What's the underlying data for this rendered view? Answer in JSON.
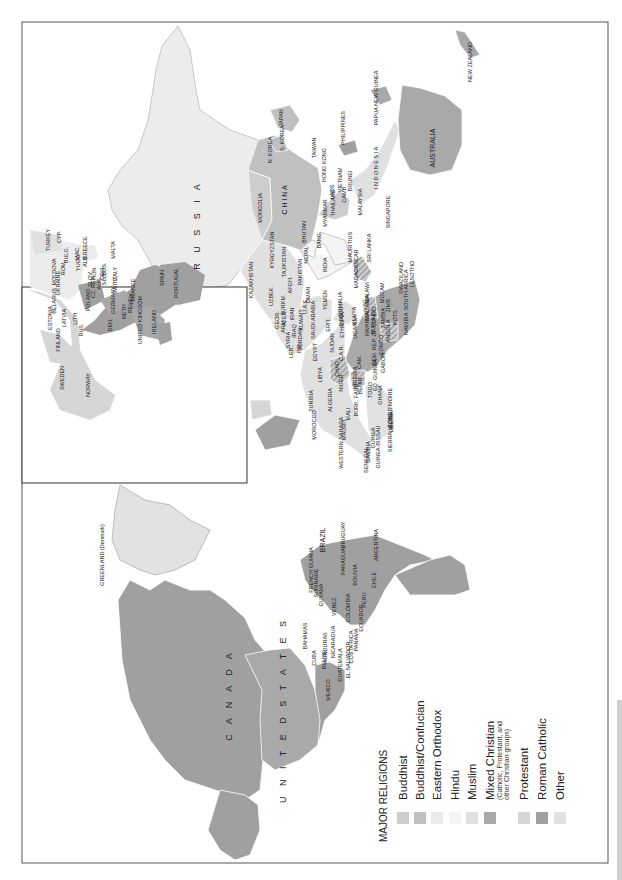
{
  "map": {
    "title": "MAJOR RELIGIONS",
    "orientation": "rotated 90° counterclockwise",
    "legend": [
      {
        "label": "Buddhist",
        "color": "#cdcdcd"
      },
      {
        "label": "Buddhist/Confucian",
        "color": "#c0c0c0"
      },
      {
        "label": "Eastern Orthodox",
        "color": "#ebebeb"
      },
      {
        "label": "Hindu",
        "color": "#f4f4f4"
      },
      {
        "label": "Muslim",
        "color": "#e0e0e0"
      },
      {
        "label": "Mixed Christian",
        "sublabel": "(Catholic, Protestant, and other Christian groups)",
        "color": "#a9a9a9"
      },
      {
        "label": "Protestant",
        "color": "#d6d6d6"
      },
      {
        "label": "Roman Catholic",
        "color": "#a0a0a0"
      },
      {
        "label": "Other",
        "color": "#e2e2e2"
      }
    ],
    "labels": [
      {
        "text": "R U S S I A",
        "x": 200,
        "y": 225,
        "size": "big"
      },
      {
        "text": "MONGOLIA",
        "x": 262,
        "y": 208
      },
      {
        "text": "C H I N A",
        "x": 287,
        "y": 200,
        "size": "mid"
      },
      {
        "text": "N. KOREA",
        "x": 272,
        "y": 150
      },
      {
        "text": "S. KOREA",
        "x": 284,
        "y": 138
      },
      {
        "text": "JAPAN",
        "x": 283,
        "y": 118
      },
      {
        "text": "TAIWAN",
        "x": 316,
        "y": 148
      },
      {
        "text": "HONG KONG",
        "x": 326,
        "y": 165
      },
      {
        "text": "PHILIPPINES",
        "x": 345,
        "y": 128
      },
      {
        "text": "VIETNAM",
        "x": 342,
        "y": 180
      },
      {
        "text": "LAOS",
        "x": 334,
        "y": 192
      },
      {
        "text": "THAILAND",
        "x": 335,
        "y": 203
      },
      {
        "text": "CAMB.",
        "x": 346,
        "y": 194
      },
      {
        "text": "MYANMAR",
        "x": 327,
        "y": 213
      },
      {
        "text": "BRUNEI",
        "x": 352,
        "y": 181
      },
      {
        "text": "MALAYSIA",
        "x": 362,
        "y": 202
      },
      {
        "text": "SINGAPORE",
        "x": 390,
        "y": 212
      },
      {
        "text": "I N D O N E S I A",
        "x": 378,
        "y": 168
      },
      {
        "text": "PAPUA NEW GUINEA",
        "x": 378,
        "y": 98
      },
      {
        "text": "AUSTRALIA",
        "x": 435,
        "y": 148,
        "size": "mid"
      },
      {
        "text": "NEW ZEALAND",
        "x": 472,
        "y": 62
      },
      {
        "text": "BHUTAN",
        "x": 306,
        "y": 232
      },
      {
        "text": "NEPAL",
        "x": 308,
        "y": 255
      },
      {
        "text": "BANG.",
        "x": 321,
        "y": 240
      },
      {
        "text": "INDIA",
        "x": 327,
        "y": 265
      },
      {
        "text": "SRI LANKA",
        "x": 371,
        "y": 248
      },
      {
        "text": "KYRGYZSTAN",
        "x": 274,
        "y": 250
      },
      {
        "text": "TAJIKISTAN",
        "x": 286,
        "y": 262
      },
      {
        "text": "KAZAKHSTAN",
        "x": 253,
        "y": 280
      },
      {
        "text": "UZBEK.",
        "x": 273,
        "y": 296
      },
      {
        "text": "TURKM.",
        "x": 285,
        "y": 305
      },
      {
        "text": "AFGH.",
        "x": 292,
        "y": 285
      },
      {
        "text": "PAKISTAN",
        "x": 302,
        "y": 272
      },
      {
        "text": "IRAN",
        "x": 294,
        "y": 314
      },
      {
        "text": "IRAQ",
        "x": 296,
        "y": 331
      },
      {
        "text": "KUWAIT",
        "x": 303,
        "y": 320
      },
      {
        "text": "U.A.E.",
        "x": 307,
        "y": 306
      },
      {
        "text": "OMAN",
        "x": 310,
        "y": 295
      },
      {
        "text": "SAUDI ARABIA",
        "x": 315,
        "y": 320
      },
      {
        "text": "YEMEN",
        "x": 327,
        "y": 300
      },
      {
        "text": "SYRIA",
        "x": 290,
        "y": 340
      },
      {
        "text": "JORDAN",
        "x": 302,
        "y": 339
      },
      {
        "text": "ISR.",
        "x": 301,
        "y": 348
      },
      {
        "text": "LEB.",
        "x": 293,
        "y": 352
      },
      {
        "text": "GEOR.",
        "x": 279,
        "y": 320
      },
      {
        "text": "ARM.",
        "x": 285,
        "y": 326
      },
      {
        "text": "AZER.",
        "x": 286,
        "y": 318
      },
      {
        "text": "EGYPT",
        "x": 317,
        "y": 352
      },
      {
        "text": "ERIT.",
        "x": 330,
        "y": 325
      },
      {
        "text": "DJIBOUTI",
        "x": 343,
        "y": 314
      },
      {
        "text": "ETHIOPIA",
        "x": 344,
        "y": 325
      },
      {
        "text": "SOMALIA",
        "x": 342,
        "y": 304
      },
      {
        "text": "SUDAN",
        "x": 334,
        "y": 343
      },
      {
        "text": "KENYA",
        "x": 356,
        "y": 316
      },
      {
        "text": "TANZANIA",
        "x": 369,
        "y": 308
      },
      {
        "text": "MALAWI",
        "x": 369,
        "y": 293
      },
      {
        "text": "MADAGASCAR",
        "x": 358,
        "y": 269
      },
      {
        "text": "MAURITIUS",
        "x": 352,
        "y": 247
      },
      {
        "text": "MOZAM.",
        "x": 384,
        "y": 292
      },
      {
        "text": "ZIMB.",
        "x": 390,
        "y": 305
      },
      {
        "text": "SWAZILAND",
        "x": 403,
        "y": 278
      },
      {
        "text": "LESOTHO",
        "x": 414,
        "y": 274
      },
      {
        "text": "SOUTH AFRICA",
        "x": 408,
        "y": 290
      },
      {
        "text": "BOTS.",
        "x": 397,
        "y": 317
      },
      {
        "text": "NAMIBIA",
        "x": 408,
        "y": 324
      },
      {
        "text": "ZAMBIA",
        "x": 385,
        "y": 318
      },
      {
        "text": "ANGOLA",
        "x": 390,
        "y": 331
      },
      {
        "text": "RWANDA",
        "x": 369,
        "y": 324
      },
      {
        "text": "BURUNDI",
        "x": 375,
        "y": 322
      },
      {
        "text": "UGANDA",
        "x": 357,
        "y": 327
      },
      {
        "text": "DEM. REP. OF CONGO",
        "x": 376,
        "y": 336
      },
      {
        "text": "CONGO",
        "x": 383,
        "y": 345
      },
      {
        "text": "C.A.R.",
        "x": 343,
        "y": 353
      },
      {
        "text": "CHAD",
        "x": 339,
        "y": 369
      },
      {
        "text": "LIBYA",
        "x": 322,
        "y": 375
      },
      {
        "text": "TUNISIA",
        "x": 313,
        "y": 401
      },
      {
        "text": "ALGERIA",
        "x": 332,
        "y": 400
      },
      {
        "text": "MOROCCO",
        "x": 316,
        "y": 425
      },
      {
        "text": "NIGER",
        "x": 343,
        "y": 383
      },
      {
        "text": "NIGERIA",
        "x": 357,
        "y": 378
      },
      {
        "text": "CAM.",
        "x": 361,
        "y": 362
      },
      {
        "text": "GABON",
        "x": 385,
        "y": 363
      },
      {
        "text": "EQ. GUINEA",
        "x": 377,
        "y": 375
      },
      {
        "text": "MALI",
        "x": 350,
        "y": 414
      },
      {
        "text": "BURK. FASO",
        "x": 358,
        "y": 400
      },
      {
        "text": "BENIN",
        "x": 362,
        "y": 386
      },
      {
        "text": "TOGO",
        "x": 372,
        "y": 390
      },
      {
        "text": "GHANA",
        "x": 382,
        "y": 395
      },
      {
        "text": "COTE D'IVOIRE",
        "x": 392,
        "y": 408
      },
      {
        "text": "LIBERIA",
        "x": 393,
        "y": 422
      },
      {
        "text": "SIERRA LEONE",
        "x": 392,
        "y": 432
      },
      {
        "text": "GUINEA",
        "x": 375,
        "y": 438
      },
      {
        "text": "GUINEA-BISSAU",
        "x": 380,
        "y": 447
      },
      {
        "text": "GAMBIA",
        "x": 370,
        "y": 452
      },
      {
        "text": "SENEGAL",
        "x": 368,
        "y": 460
      },
      {
        "text": "MAURIT.",
        "x": 346,
        "y": 429
      },
      {
        "text": "WESTERN SAHARA",
        "x": 343,
        "y": 443
      },
      {
        "text": "FINLAND",
        "x": 60,
        "y": 340
      },
      {
        "text": "SWEDEN",
        "x": 64,
        "y": 378
      },
      {
        "text": "NORWAY",
        "x": 90,
        "y": 385
      },
      {
        "text": "ESTONIA",
        "x": 52,
        "y": 318
      },
      {
        "text": "LATVIA",
        "x": 66,
        "y": 318
      },
      {
        "text": "LITH.",
        "x": 77,
        "y": 318
      },
      {
        "text": "RUS.",
        "x": 83,
        "y": 330
      },
      {
        "text": "BELARUS",
        "x": 56,
        "y": 301
      },
      {
        "text": "UKRAINE",
        "x": 60,
        "y": 283
      },
      {
        "text": "MOLDOVA",
        "x": 56,
        "y": 272
      },
      {
        "text": "ROM.",
        "x": 65,
        "y": 268
      },
      {
        "text": "BULG.",
        "x": 68,
        "y": 255
      },
      {
        "text": "TURKEY",
        "x": 50,
        "y": 240
      },
      {
        "text": "CYP.",
        "x": 61,
        "y": 237
      },
      {
        "text": "GREECE",
        "x": 87,
        "y": 248
      },
      {
        "text": "MAC.",
        "x": 79,
        "y": 253
      },
      {
        "text": "YUGO.",
        "x": 80,
        "y": 262
      },
      {
        "text": "ALB.",
        "x": 87,
        "y": 261
      },
      {
        "text": "MALTA",
        "x": 115,
        "y": 250
      },
      {
        "text": "POLAND",
        "x": 90,
        "y": 300
      },
      {
        "text": "CZ. REP.",
        "x": 95,
        "y": 287
      },
      {
        "text": "SLOV.",
        "x": 92,
        "y": 279
      },
      {
        "text": "HUN.",
        "x": 96,
        "y": 273
      },
      {
        "text": "AUS.",
        "x": 101,
        "y": 283
      },
      {
        "text": "SLO.",
        "x": 106,
        "y": 279
      },
      {
        "text": "CRO.",
        "x": 104,
        "y": 273
      },
      {
        "text": "BOS.",
        "x": 106,
        "y": 269
      },
      {
        "text": "SWITZ.",
        "x": 117,
        "y": 285
      },
      {
        "text": "ITALY",
        "x": 117,
        "y": 274
      },
      {
        "text": "GERMANY",
        "x": 115,
        "y": 300
      },
      {
        "text": "DEN.",
        "x": 112,
        "y": 325
      },
      {
        "text": "NETH.",
        "x": 126,
        "y": 311
      },
      {
        "text": "BELG.",
        "x": 132,
        "y": 305
      },
      {
        "text": "LUX.",
        "x": 133,
        "y": 298
      },
      {
        "text": "FRANCE",
        "x": 135,
        "y": 290
      },
      {
        "text": "UNITED KINGDOM",
        "x": 142,
        "y": 320
      },
      {
        "text": "IRELAND",
        "x": 156,
        "y": 322
      },
      {
        "text": "SPAIN",
        "x": 164,
        "y": 278
      },
      {
        "text": "PORTUGAL",
        "x": 178,
        "y": 283
      },
      {
        "text": "GREENLAND (Denmark)",
        "x": 104,
        "y": 555
      },
      {
        "text": "C A N A D A",
        "x": 232,
        "y": 695,
        "size": "big"
      },
      {
        "text": "U N I T E D   S T A T E S",
        "x": 286,
        "y": 710,
        "size": "big"
      },
      {
        "text": "MEXICO",
        "x": 330,
        "y": 690
      },
      {
        "text": "CUBA",
        "x": 316,
        "y": 658
      },
      {
        "text": "BAHAMAS",
        "x": 307,
        "y": 636
      },
      {
        "text": "BELIZE",
        "x": 326,
        "y": 660
      },
      {
        "text": "HONDURAS",
        "x": 327,
        "y": 648
      },
      {
        "text": "NICARAGUA",
        "x": 335,
        "y": 642
      },
      {
        "text": "GUATEMALA",
        "x": 342,
        "y": 665
      },
      {
        "text": "EL SALVADOR",
        "x": 350,
        "y": 660
      },
      {
        "text": "COSTA RICA",
        "x": 353,
        "y": 647
      },
      {
        "text": "PANAMA",
        "x": 358,
        "y": 640
      },
      {
        "text": "ECUADOR",
        "x": 363,
        "y": 618
      },
      {
        "text": "COLOMBIA",
        "x": 350,
        "y": 608
      },
      {
        "text": "VENEZ.",
        "x": 336,
        "y": 606
      },
      {
        "text": "GUYANA",
        "x": 323,
        "y": 595
      },
      {
        "text": "SURINAME",
        "x": 318,
        "y": 583
      },
      {
        "text": "FRENCH GUIANA",
        "x": 313,
        "y": 570
      },
      {
        "text": "BRAZIL",
        "x": 325,
        "y": 540,
        "size": "mid"
      },
      {
        "text": "PERU",
        "x": 366,
        "y": 600
      },
      {
        "text": "BOLIVIA",
        "x": 357,
        "y": 575
      },
      {
        "text": "PARAGUAY",
        "x": 345,
        "y": 560
      },
      {
        "text": "CHILE",
        "x": 376,
        "y": 580
      },
      {
        "text": "URUGUAY",
        "x": 345,
        "y": 535
      },
      {
        "text": "ARGENTINA",
        "x": 378,
        "y": 545
      }
    ]
  }
}
